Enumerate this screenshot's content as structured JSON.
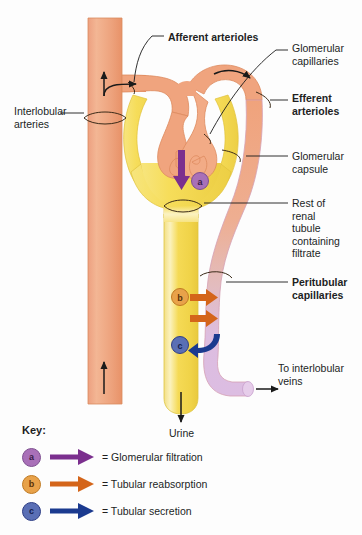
{
  "diagram": {
    "labels": {
      "afferent_arterioles": "Afferent arterioles",
      "glomerular_capillaries": "Glomerular\ncapillaries",
      "efferent_arterioles": "Efferent\narterioles",
      "glomerular_capsule": "Glomerular\ncapsule",
      "rest_of_tubule": "Rest of\nrenal\ntubule\ncontaining\nfiltrate",
      "peritubular_capillaries": "Peritubular\ncapillaries",
      "to_interlobular_veins": "To interlobular\nveins",
      "interlobular_arteries": "Interlobular\narteries",
      "urine": "Urine"
    },
    "markers": {
      "a": "a",
      "b": "b",
      "c": "c"
    }
  },
  "key": {
    "title": "Key:",
    "items": [
      {
        "badge": "a",
        "text": "= Glomerular filtration",
        "badge_color": "#a970b8",
        "badge_edge": "#7e4f90",
        "arrow_color": "#7b2f8e"
      },
      {
        "badge": "b",
        "text": "= Tubular reabsorption",
        "badge_color": "#e8a24a",
        "badge_edge": "#c07a22",
        "arrow_color": "#d4651a"
      },
      {
        "badge": "c",
        "text": "= Tubular secretion",
        "badge_color": "#5a6fb5",
        "badge_edge": "#2f3f86",
        "arrow_color": "#1b3a8f"
      }
    ]
  },
  "colors": {
    "artery_salmon": "#f0a07a",
    "artery_salmon_light": "#f7c2a4",
    "artery_edge": "#e08a5f",
    "capsule_yellow": "#f5dd5c",
    "capsule_yellow_light": "#faf0a8",
    "tubule_yellow": "#f2d94e",
    "peritubular_lavender": "#ddbde0",
    "peritubular_edge": "#c59cc9",
    "outline": "#b5651f",
    "text": "#221f1f",
    "filtration_purple": "#7b2f8e",
    "reabsorption_orange": "#d4651a",
    "secretion_blue": "#1b3a8f"
  }
}
